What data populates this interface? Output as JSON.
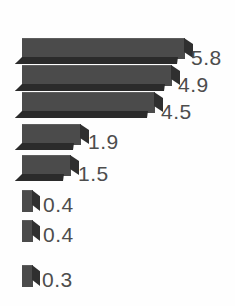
{
  "chart_data": {
    "type": "bar",
    "orientation": "horizontal",
    "title": "",
    "subtitle": "",
    "xlabel": "",
    "ylabel": "",
    "grid": false,
    "legend": null,
    "axis_visible": false,
    "tick_labels": [],
    "categories": [
      "",
      "",
      "",
      "",
      "",
      "",
      "",
      ""
    ],
    "values": [
      5.8,
      4.9,
      4.5,
      1.9,
      1.5,
      0.4,
      0.4,
      0.3
    ],
    "data_labels": [
      "5.8",
      "4.9",
      "4.5",
      "1.9",
      "1.5",
      "0.4",
      "0.4",
      "0.3"
    ],
    "xlim": [
      0,
      5.8
    ],
    "style": "3d-extruded",
    "colors": {
      "bar_face": "#4b4b4b",
      "bar_shadow": "#2b2b2b",
      "label_text": "#4d4d4d",
      "background": "#fefefe"
    }
  },
  "bars": [
    {
      "label": "5.8",
      "value": 5.8,
      "x": 22,
      "y": 38,
      "width": 163,
      "height": 20,
      "label_x": 191,
      "label_y": 47
    },
    {
      "label": "4.9",
      "value": 4.9,
      "x": 22,
      "y": 65,
      "width": 150,
      "height": 20,
      "label_x": 178,
      "label_y": 74
    },
    {
      "label": "4.5",
      "value": 4.5,
      "x": 22,
      "y": 92,
      "width": 133,
      "height": 20,
      "label_x": 161,
      "label_y": 101
    },
    {
      "label": "1.9",
      "value": 1.9,
      "x": 22,
      "y": 124,
      "width": 59,
      "height": 20,
      "label_x": 88,
      "label_y": 131
    },
    {
      "label": "1.5",
      "value": 1.5,
      "x": 22,
      "y": 155,
      "width": 49,
      "height": 20,
      "label_x": 78,
      "label_y": 163
    },
    {
      "label": "0.4",
      "value": 0.4,
      "x": 22,
      "y": 190,
      "width": 11,
      "height": 21,
      "label_x": 43,
      "label_y": 194
    },
    {
      "label": "0.4",
      "value": 0.4,
      "x": 22,
      "y": 220,
      "width": 11,
      "height": 21,
      "label_x": 43,
      "label_y": 224
    },
    {
      "label": "0.3",
      "value": 0.3,
      "x": 22,
      "y": 265,
      "width": 11,
      "height": 21,
      "label_x": 42,
      "label_y": 269
    }
  ]
}
